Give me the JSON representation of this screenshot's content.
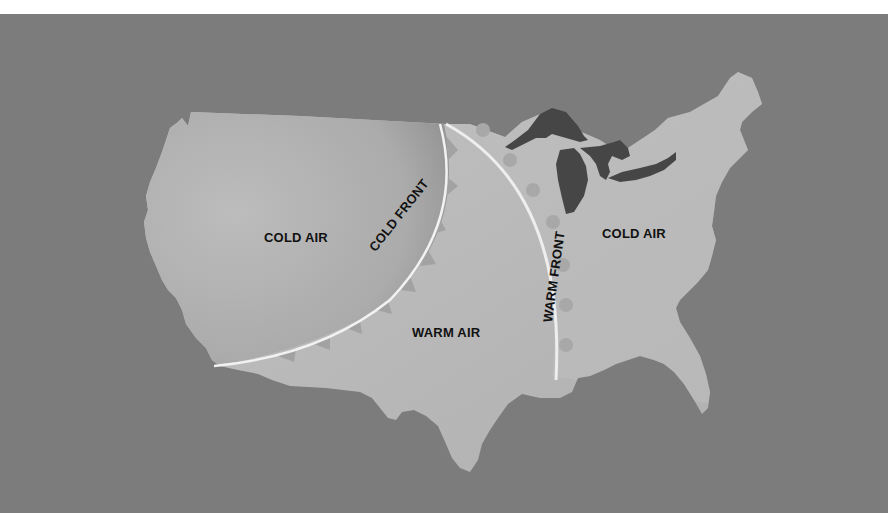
{
  "diagram": {
    "colors": {
      "background": "#7c7c7c",
      "land": "#b9b9b9",
      "land_cold_shade": "#a8a8a8",
      "lakes": "#4a4a4a",
      "front_line": "#f2f2f2",
      "front_symbols": "#a2a2a2",
      "text": "#111111"
    },
    "regions": {
      "cold_air_west": "COLD AIR",
      "warm_air": "WARM AIR",
      "cold_air_east": "COLD AIR"
    },
    "fronts": {
      "cold_front": {
        "label": "COLD FRONT",
        "symbol": "triangle-icon"
      },
      "warm_front": {
        "label": "WARM FRONT",
        "symbol": "semicircle-icon"
      }
    },
    "features": [
      "Great Lakes"
    ]
  }
}
